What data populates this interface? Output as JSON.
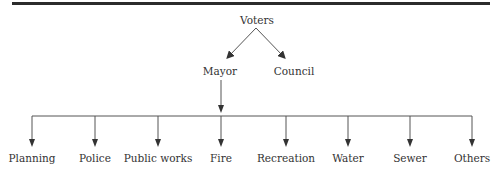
{
  "diagram": {
    "root": {
      "label": "Voters"
    },
    "level1": [
      {
        "label": "Mayor"
      },
      {
        "label": "Council"
      }
    ],
    "departments": [
      {
        "label": "Planning"
      },
      {
        "label": "Police"
      },
      {
        "label": "Public works"
      },
      {
        "label": "Fire"
      },
      {
        "label": "Recreation"
      },
      {
        "label": "Water"
      },
      {
        "label": "Sewer"
      },
      {
        "label": "Others"
      }
    ],
    "colors": {
      "line": "#555555",
      "text": "#333333",
      "rule": "#2b2b2b"
    }
  }
}
